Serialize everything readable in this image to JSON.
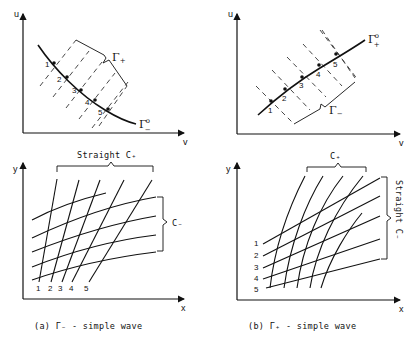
{
  "figure": {
    "panel_a": {
      "top_plot": {
        "axis_x": "v",
        "axis_y": "u",
        "curve_label": "Γ°₋",
        "curve_label_main": "Γ",
        "curve_label_sup": "o",
        "curve_label_sub": "−",
        "bracket_label_main": "Γ",
        "bracket_label_sub": "+",
        "points": [
          "1",
          "2",
          "3",
          "4",
          "5"
        ]
      },
      "bottom_plot": {
        "axis_x": "x",
        "axis_y": "y",
        "top_bracket_label": "Straight C₊",
        "right_bracket_label": "C₋",
        "line_labels": [
          "1",
          "2",
          "3",
          "4",
          "5"
        ]
      },
      "caption": "(a) Γ₋ - simple wave"
    },
    "panel_b": {
      "top_plot": {
        "axis_x": "v",
        "axis_y": "u",
        "curve_label_main": "Γ",
        "curve_label_sup": "o",
        "curve_label_sub": "+",
        "bracket_label_main": "Γ",
        "bracket_label_sub": "−",
        "points": [
          "1",
          "2",
          "3",
          "4",
          "5"
        ]
      },
      "bottom_plot": {
        "axis_x": "x",
        "axis_y": "y",
        "top_bracket_label": "C₊",
        "right_bracket_label": "Straight C₋",
        "line_labels": [
          "1",
          "2",
          "3",
          "4",
          "5"
        ]
      },
      "caption": "(b) Γ₊ - simple wave"
    }
  }
}
